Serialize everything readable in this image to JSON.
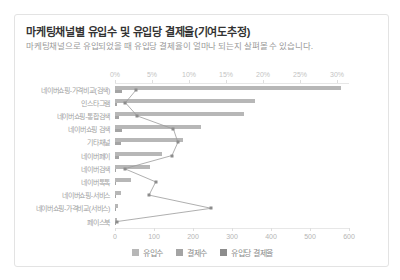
{
  "header": {
    "title": "마케팅채널별 유입수 및 유입당 결제율(기여도추정)",
    "subtitle": "마케팅채널으로 유입되었을 때 유입당 결제율이 얼마나 되는지 살펴볼 수 있습니다."
  },
  "chart_data": {
    "type": "bar",
    "orientation": "horizontal",
    "title": "마케팅채널별 유입수 및 유입당 결제율(기여도추정)",
    "categories": [
      "네이버쇼핑-가격비교(검색)",
      "인스타그램",
      "네이버쇼핑-통합검색",
      "네이버쇼핑 검색",
      "기타채널",
      "네이버페이",
      "네이버검색",
      "네이버톡톡",
      "네이버쇼핑-서비스",
      "네이버쇼핑-가격비교(서비스)",
      "페이스북"
    ],
    "series": [
      {
        "name": "유입수",
        "type": "bar",
        "axis": "bottom",
        "color": "#b7b7b7",
        "values": [
          580,
          360,
          330,
          220,
          175,
          120,
          90,
          40,
          15,
          8,
          5
        ]
      },
      {
        "name": "결제수",
        "type": "bar",
        "axis": "bottom",
        "color": "#a4a4a4",
        "values": [
          17,
          5,
          10,
          17,
          15,
          9,
          1,
          2,
          1,
          1,
          0
        ]
      },
      {
        "name": "유입당 결제율",
        "type": "line",
        "axis": "top",
        "color": "#8c8c8c",
        "line_color": "#9b9b9b",
        "values": [
          2.9,
          1.4,
          3.0,
          7.9,
          8.5,
          7.7,
          1.3,
          5.5,
          4.6,
          13.0,
          0.3
        ]
      }
    ],
    "top_axis": {
      "min": 0,
      "max": 30,
      "unit": "%",
      "ticks": [
        "0%",
        "5%",
        "10%",
        "15%",
        "20%",
        "25%",
        "30%"
      ]
    },
    "bottom_axis": {
      "min": 0,
      "max": 600,
      "ticks": [
        "0",
        "100",
        "200",
        "300",
        "400",
        "500",
        "600"
      ]
    },
    "legend": [
      "유입수",
      "결제수",
      "유입당 결제율"
    ],
    "legend_position": "bottom"
  }
}
